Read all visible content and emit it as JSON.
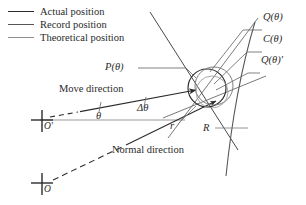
{
  "figure": {
    "kind": "geometry-diagram",
    "background": "#ffffff",
    "ink": "#2b2b2b",
    "ink_mid": "#555555",
    "ink_light": "#8d8d8d"
  },
  "legend": {
    "items": [
      {
        "label": "Actual position",
        "style": "solid-heavy"
      },
      {
        "label": "Record position",
        "style": "solid-medium"
      },
      {
        "label": "Theoretical position",
        "style": "solid-light"
      }
    ]
  },
  "labels": {
    "p_theta": "P(θ)",
    "q_theta": "Q(θ)",
    "c_theta": "C(θ)",
    "q_theta_prime": "Q(θ)'",
    "move_direction": "Move direction",
    "normal_direction": "Normal direction",
    "theta": "θ",
    "delta_theta": "Δθ",
    "r_small": "r",
    "r_big": "R",
    "origin_prime": "O'",
    "origin": "O"
  },
  "marks": {
    "origin_prime_cross": "cross-marker",
    "origin_cross": "cross-marker",
    "move_arrow": "arrow-head",
    "normal_arrow": "arrow-head"
  }
}
